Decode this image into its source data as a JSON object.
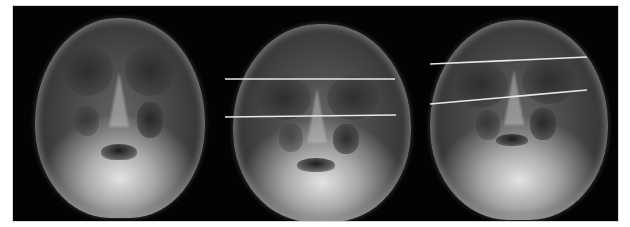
{
  "figure": {
    "background_color": "#ffffff",
    "border_color": "#d8d8d8",
    "line_color": "#e8e8e8",
    "panels": [
      {
        "id": "panel-1",
        "label": "",
        "width": 202,
        "skull": {
          "left": 22,
          "top": 12,
          "width": 170,
          "height": 200
        },
        "lines": []
      },
      {
        "id": "panel-2",
        "label": "",
        "width": 207,
        "skull": {
          "left": 18,
          "top": 18,
          "width": 178,
          "height": 198
        },
        "lines": [
          {
            "x1": 10,
            "y1": 73,
            "x2": 180,
            "y2": 73
          },
          {
            "x1": 10,
            "y1": 111,
            "x2": 181,
            "y2": 109
          }
        ]
      },
      {
        "id": "panel-3",
        "label": "",
        "width": 196,
        "skull": {
          "left": 8,
          "top": 14,
          "width": 178,
          "height": 200
        },
        "lines": [
          {
            "x1": 8,
            "y1": 58,
            "x2": 165,
            "y2": 51
          },
          {
            "x1": 8,
            "y1": 98,
            "x2": 165,
            "y2": 84
          }
        ]
      }
    ]
  }
}
